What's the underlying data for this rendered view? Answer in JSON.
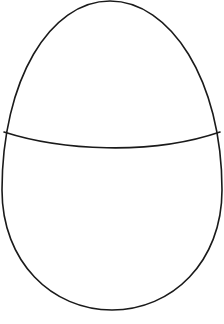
{
  "figure": {
    "background_color": "#ffffff",
    "stroke_color": "#1a1a1a",
    "stroke_width": 1.6,
    "egg_outline_path": "M 110 1 C 170 1, 222 80, 222 190 C 222 262, 172 310, 112 310 C 52 310, 2 262, 2 190 C 2 80, 50 1, 110 1 Z",
    "crack_line_path": "M 4 132 C 60 150, 150 156, 220 132"
  }
}
